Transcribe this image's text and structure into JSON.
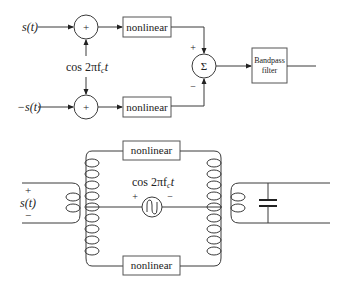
{
  "top_diagram": {
    "input_top_label": "s(t)",
    "input_bottom_label": "−s(t)",
    "adder_symbol": "+",
    "carrier_label": "cos 2πf",
    "carrier_sub": "c",
    "carrier_t": "t",
    "nonlinear_top_label": "nonlinear",
    "nonlinear_bottom_label": "nonlinear",
    "sum_symbol": "Σ",
    "sum_plus_sign": "+",
    "sum_minus_sign": "−",
    "filter_line1": "Bandpass",
    "filter_line2": "filter"
  },
  "bottom_diagram": {
    "nonlinear_top_label": "nonlinear",
    "nonlinear_bottom_label": "nonlinear",
    "carrier_label": "cos 2πf",
    "carrier_sub": "c",
    "carrier_t": "t",
    "source_plus": "+",
    "source_minus": "−",
    "input_plus": "+",
    "input_label": "s(t)",
    "input_minus": "−"
  },
  "colors": {
    "stroke": "#3a3a3a",
    "text": "#222222",
    "background": "#ffffff"
  }
}
